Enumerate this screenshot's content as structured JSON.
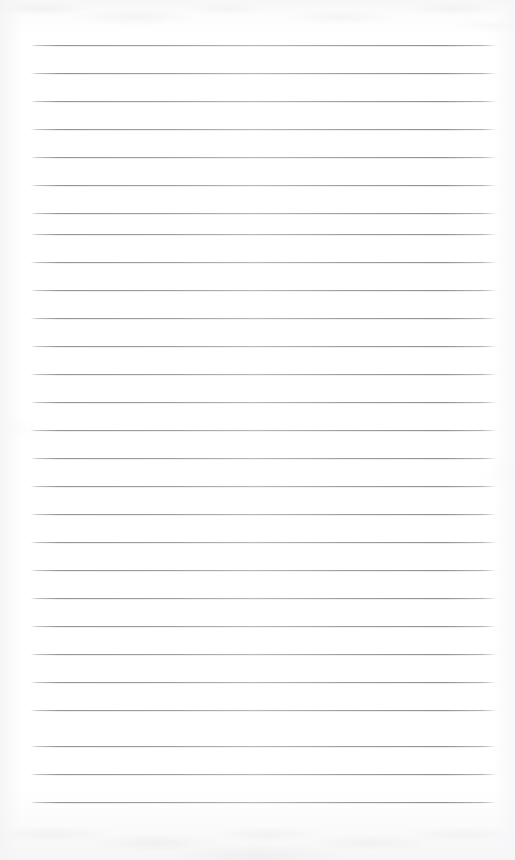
{
  "document": {
    "type": "scanned-lined-notepad-page",
    "title": "Blank ruled notepad page",
    "content_text": "",
    "page_width": 515,
    "page_height": 860,
    "paper_color": "#fdfdfd",
    "line_color": "#8e8e93",
    "has_handwriting": false,
    "has_printed_text": false,
    "margin_rule": false
  },
  "ruling": {
    "line_count": 28,
    "first_line_y": 45,
    "line_spacing": 28.05,
    "line_left_x": 30,
    "line_right_x": 497,
    "line_thickness": 1,
    "orientation": "horizontal"
  },
  "lines": [
    {
      "index": 1,
      "y": 45,
      "x1": 30,
      "x2": 497
    },
    {
      "index": 2,
      "y": 73,
      "x1": 30,
      "x2": 497
    },
    {
      "index": 3,
      "y": 101,
      "x1": 30,
      "x2": 497
    },
    {
      "index": 4,
      "y": 129,
      "x1": 30,
      "x2": 497
    },
    {
      "index": 5,
      "y": 157,
      "x1": 30,
      "x2": 497
    },
    {
      "index": 6,
      "y": 185,
      "x1": 30,
      "x2": 497
    },
    {
      "index": 7,
      "y": 213,
      "x1": 30,
      "x2": 497
    },
    {
      "index": 8,
      "y": 234,
      "x1": 30,
      "x2": 497
    },
    {
      "index": 9,
      "y": 262,
      "x1": 30,
      "x2": 497
    },
    {
      "index": 10,
      "y": 290,
      "x1": 30,
      "x2": 497
    },
    {
      "index": 11,
      "y": 318,
      "x1": 30,
      "x2": 497
    },
    {
      "index": 12,
      "y": 346,
      "x1": 30,
      "x2": 497
    },
    {
      "index": 13,
      "y": 374,
      "x1": 30,
      "x2": 497
    },
    {
      "index": 14,
      "y": 402,
      "x1": 30,
      "x2": 497
    },
    {
      "index": 15,
      "y": 430,
      "x1": 30,
      "x2": 497
    },
    {
      "index": 16,
      "y": 458,
      "x1": 30,
      "x2": 497
    },
    {
      "index": 17,
      "y": 486,
      "x1": 30,
      "x2": 497
    },
    {
      "index": 18,
      "y": 514,
      "x1": 30,
      "x2": 497
    },
    {
      "index": 19,
      "y": 542,
      "x1": 30,
      "x2": 497
    },
    {
      "index": 20,
      "y": 570,
      "x1": 30,
      "x2": 497
    },
    {
      "index": 21,
      "y": 598,
      "x1": 30,
      "x2": 497
    },
    {
      "index": 22,
      "y": 626,
      "x1": 30,
      "x2": 497
    },
    {
      "index": 23,
      "y": 654,
      "x1": 30,
      "x2": 497
    },
    {
      "index": 24,
      "y": 682,
      "x1": 30,
      "x2": 497
    },
    {
      "index": 25,
      "y": 710,
      "x1": 30,
      "x2": 497
    },
    {
      "index": 26,
      "y": 746,
      "x1": 30,
      "x2": 497
    },
    {
      "index": 27,
      "y": 774,
      "x1": 30,
      "x2": 497
    },
    {
      "index": 28,
      "y": 802,
      "x1": 30,
      "x2": 497
    }
  ]
}
